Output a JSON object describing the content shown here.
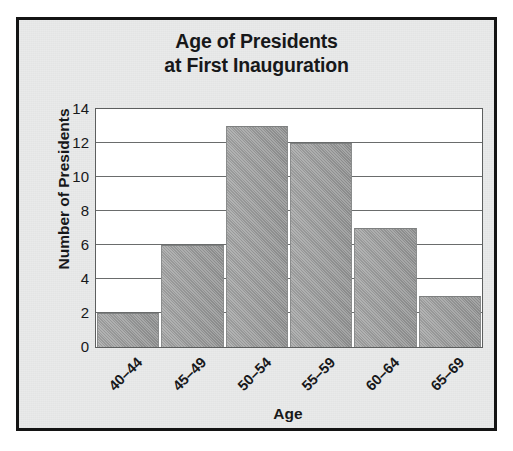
{
  "chart_data": {
    "type": "bar",
    "title": "Age of Presidents at First Inauguration",
    "title_lines": [
      "Age of Presidents",
      "at First Inauguration"
    ],
    "categories": [
      "40–44",
      "45–49",
      "50–54",
      "55–59",
      "60–64",
      "65–69"
    ],
    "values": [
      2,
      6,
      13,
      12,
      7,
      3
    ],
    "xlabel": "Age",
    "ylabel": "Number of Presidents",
    "ylim": [
      0,
      14
    ],
    "ytick_labels": [
      "14",
      "12",
      "10",
      "8",
      "6",
      "4",
      "2",
      "0"
    ],
    "ytick_values": [
      14,
      12,
      10,
      8,
      6,
      4,
      2,
      0
    ],
    "ytick_step": 2,
    "grid": "horizontal",
    "legend": "none",
    "bar_color": "#9a9b9b",
    "gridline_color": "#6a6c6c",
    "plot_background": "#ffffff",
    "figure_background": "#e9eaea",
    "frame_color": "#141414",
    "text_color": "#17181a"
  }
}
